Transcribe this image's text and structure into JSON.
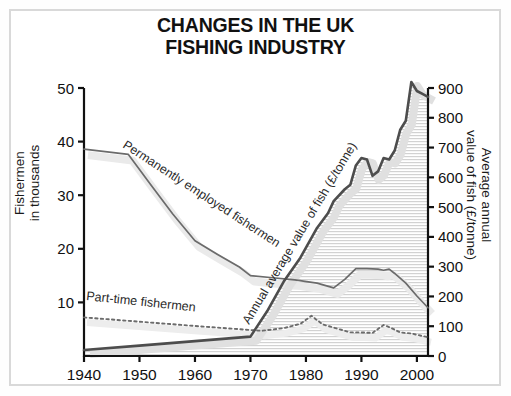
{
  "chart_data": {
    "type": "line",
    "title": "CHANGES IN THE UK\nFISHING INDUSTRY",
    "xlabel": "",
    "ylabel": "Fishermen\nin thousands",
    "y2label": "Average annual\nvalue of fish (£/tonne)",
    "xlim": [
      1940,
      2002
    ],
    "ylim": [
      0,
      50
    ],
    "y2lim": [
      0,
      900
    ],
    "xticks": [
      1940,
      1950,
      1960,
      1970,
      1980,
      1990,
      2000
    ],
    "xticklabels": [
      "1940",
      "1950",
      "1960",
      "1970",
      "1980",
      "1990",
      "2000"
    ],
    "yticks": [
      10,
      20,
      30,
      40,
      50
    ],
    "yticklabels": [
      "10",
      "20",
      "30",
      "40",
      "50"
    ],
    "y2ticks": [
      0,
      100,
      200,
      300,
      400,
      500,
      600,
      700,
      800,
      900
    ],
    "y2ticklabels": [
      "0",
      "100",
      "200",
      "300",
      "400",
      "500",
      "600",
      "700",
      "800",
      "900"
    ],
    "grid": false,
    "legend": "inline-annotations",
    "series": [
      {
        "name": "Permanently employed fishermen",
        "axis": "left",
        "style": "solid",
        "color": "#6b6b6b",
        "x": [
          1940,
          1948,
          1952,
          1956,
          1960,
          1964,
          1968,
          1970,
          1974,
          1978,
          1982,
          1985,
          1987,
          1989,
          1991,
          1993,
          1994,
          1995,
          1996,
          1998,
          2000,
          2002
        ],
        "values": [
          38.6,
          37.6,
          32.0,
          26.5,
          21.5,
          19.0,
          16.6,
          15.0,
          14.6,
          14.2,
          13.6,
          12.7,
          14.3,
          16.3,
          16.3,
          16.2,
          16.0,
          16.2,
          15.4,
          13.6,
          11.2,
          9.0
        ]
      },
      {
        "name": "Part-time fishermen",
        "axis": "left",
        "style": "dotted",
        "color": "#6b6b6b",
        "x": [
          1940,
          1950,
          1960,
          1968,
          1972,
          1976,
          1979,
          1981,
          1983,
          1985,
          1988,
          1990,
          1992,
          1994,
          1995,
          1997,
          1999,
          2002
        ],
        "values": [
          7.2,
          6.4,
          5.6,
          5.0,
          4.7,
          5.2,
          6.0,
          7.5,
          5.9,
          5.3,
          4.4,
          4.4,
          4.3,
          5.8,
          5.4,
          4.4,
          4.2,
          3.5
        ]
      },
      {
        "name": "Annual average value of fish (£/tonne)",
        "axis": "right",
        "style": "solid-thick-filled",
        "color": "#4d4d4d",
        "x": [
          1940,
          1950,
          1960,
          1970,
          1973,
          1976,
          1979,
          1982,
          1984,
          1985,
          1987,
          1988,
          1989,
          1990,
          1991,
          1992,
          1993,
          1994,
          1995,
          1996,
          1997,
          1998,
          1999,
          2000,
          2001,
          2002
        ],
        "values": [
          20,
          35,
          50,
          65,
          150,
          250,
          330,
          430,
          480,
          520,
          560,
          575,
          640,
          665,
          660,
          605,
          620,
          665,
          660,
          690,
          760,
          790,
          920,
          890,
          880,
          870
        ]
      }
    ],
    "annotations": [
      {
        "text": "Permanently employed fishermen",
        "rotation": 33
      },
      {
        "text": "Part-time fishermen",
        "rotation": 6
      },
      {
        "text": "Annual average value of fish (£/tonne)",
        "rotation": -59
      }
    ]
  }
}
